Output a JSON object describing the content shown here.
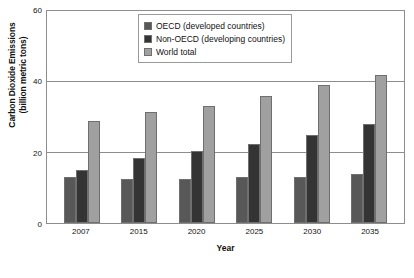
{
  "chart_data": {
    "type": "bar",
    "title": "",
    "xlabel": "Year",
    "ylabel": "Carbon Dioxide Emissions (billion metric tons)",
    "ylabel_line1": "Carbon Dioxide Emissions",
    "ylabel_line2": "(billion metric tons)",
    "categories": [
      "2007",
      "2015",
      "2020",
      "2025",
      "2030",
      "2035"
    ],
    "series": [
      {
        "name": "OECD (developed countries)",
        "color": "#585858",
        "values": [
          13,
          12.5,
          12.5,
          13,
          13,
          14
        ]
      },
      {
        "name": "Non-OECD (developing countries)",
        "color": "#343434",
        "values": [
          15,
          18.5,
          20.5,
          22.5,
          25,
          28
        ]
      },
      {
        "name": "World total",
        "color": "#a0a0a0",
        "values": [
          29,
          31.5,
          33,
          36,
          39,
          42
        ]
      }
    ],
    "ylim": [
      0,
      60
    ],
    "yticks": [
      "0",
      "20",
      "40",
      "60"
    ],
    "ytick_values": [
      0,
      20,
      40,
      60
    ],
    "grid": true,
    "legend_position": "top-center"
  },
  "legend": {
    "items": [
      {
        "label": "OECD (developed countries)",
        "swatch": "legend-swatch-oecd"
      },
      {
        "label": "Non-OECD (developing countries)",
        "swatch": "legend-swatch-non-oecd"
      },
      {
        "label": "World total",
        "swatch": "legend-swatch-world"
      }
    ]
  }
}
